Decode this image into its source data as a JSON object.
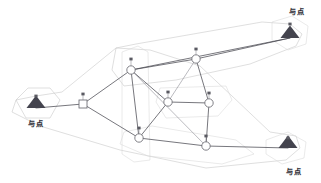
{
  "diagram": {
    "type": "network-graph",
    "canvas": {
      "width": 321,
      "height": 183
    },
    "background_color": "#ffffff",
    "colors": {
      "edge": "#4a4a52",
      "edge_light": "#8d8d95",
      "region_outline": "#c9c9c9",
      "node_fill": "#ffffff",
      "node_stroke": "#6b6b73",
      "site_marker": "#44444e",
      "label_text": "#2b2b33"
    },
    "sites": [
      {
        "id": "site-top-right",
        "label": "与点",
        "x": 290,
        "y": 38,
        "label_x": 297,
        "label_y": 14,
        "marker_x": 290,
        "marker_y": 24
      },
      {
        "id": "site-left",
        "label": "与点",
        "x": 36,
        "y": 108,
        "label_x": 36,
        "label_y": 126,
        "marker_x": 36,
        "marker_y": 96
      },
      {
        "id": "site-bottom-right",
        "label": "与点",
        "x": 288,
        "y": 148,
        "label_x": 294,
        "label_y": 174,
        "marker_x": 288,
        "marker_y": 138
      }
    ],
    "nodes": [
      {
        "id": "n1",
        "shape": "circle",
        "x": 131,
        "y": 70,
        "r": 4.2,
        "marker_x": 131,
        "marker_y": 59
      },
      {
        "id": "n2",
        "shape": "circle",
        "x": 196,
        "y": 59,
        "r": 4.2,
        "marker_x": 196,
        "marker_y": 49
      },
      {
        "id": "n3",
        "shape": "square",
        "x": 83,
        "y": 104,
        "r": 4.0,
        "marker_x": 83,
        "marker_y": 94
      },
      {
        "id": "n4",
        "shape": "circle",
        "x": 168,
        "y": 102,
        "r": 4.2,
        "marker_x": 168,
        "marker_y": 92
      },
      {
        "id": "n5",
        "shape": "circle",
        "x": 209,
        "y": 103,
        "r": 4.2,
        "marker_x": 209,
        "marker_y": 93
      },
      {
        "id": "n6",
        "shape": "circle",
        "x": 139,
        "y": 138,
        "r": 4.2,
        "marker_x": 139,
        "marker_y": 128
      },
      {
        "id": "n7",
        "shape": "circle",
        "x": 206,
        "y": 146,
        "r": 4.2,
        "marker_x": 206,
        "marker_y": 136
      }
    ],
    "edges": [
      {
        "from": "site-left",
        "to": "n3",
        "weight": "solid"
      },
      {
        "from": "n3",
        "to": "n1",
        "weight": "solid"
      },
      {
        "from": "n3",
        "to": "n6",
        "weight": "solid"
      },
      {
        "from": "n1",
        "to": "n2",
        "weight": "solid"
      },
      {
        "from": "n1",
        "to": "n4",
        "weight": "solid"
      },
      {
        "from": "n1",
        "to": "n6",
        "weight": "solid"
      },
      {
        "from": "n1",
        "to": "site-top-right",
        "weight": "solid"
      },
      {
        "from": "n2",
        "to": "site-top-right",
        "weight": "solid"
      },
      {
        "from": "n2",
        "to": "n5",
        "weight": "solid"
      },
      {
        "from": "n4",
        "to": "n5",
        "weight": "solid"
      },
      {
        "from": "n4",
        "to": "n6",
        "weight": "solid"
      },
      {
        "from": "n5",
        "to": "n7",
        "weight": "solid"
      },
      {
        "from": "n6",
        "to": "n7",
        "weight": "solid"
      },
      {
        "from": "n7",
        "to": "site-bottom-right",
        "weight": "solid"
      },
      {
        "from": "n1",
        "to": "n7",
        "weight": "light"
      },
      {
        "from": "n4",
        "to": "n2",
        "weight": "light"
      }
    ],
    "regions": [
      {
        "id": "region-outer-hull",
        "points": "36,96 16,100 12,112 40,126 120,150 206,168 286,160 300,148 296,136 270,132 232,96 200,66 150,50 116,48 62,92"
      },
      {
        "id": "region-top-band",
        "points": "116,48 136,44 262,22 290,24 302,34 296,46 250,64 176,80 124,86 112,70"
      },
      {
        "id": "region-left-pocket",
        "points": "16,100 28,88 50,88 60,100 50,118 26,118"
      },
      {
        "id": "region-mid-box",
        "points": "160,88 226,86 232,100 218,116 166,118 156,102"
      },
      {
        "id": "region-bottom-pocket",
        "points": "124,132 152,126 236,140 254,154 222,164 148,156 120,144"
      },
      {
        "id": "region-top-right-pocket",
        "points": "272,22 292,16 308,26 306,44 288,50 272,40"
      },
      {
        "id": "region-bottom-right-pocket",
        "points": "266,140 288,132 306,142 304,158 282,164 266,154"
      },
      {
        "id": "region-vertical-slab",
        "points": "122,52 138,46 148,52 150,160 134,162 122,154"
      }
    ]
  }
}
